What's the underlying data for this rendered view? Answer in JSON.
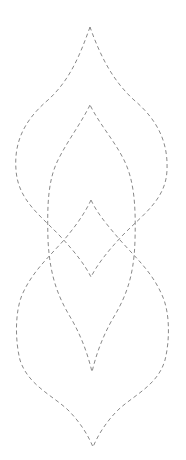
{
  "style": {
    "background": "#ffffff",
    "stroke_color": "#7a7a7a",
    "line_style": "dashed"
  },
  "shapes": [
    {
      "name": "outer-upper-leaf",
      "description": "large pointed leaf, tip at top, closes at center-diamond bottom"
    },
    {
      "name": "inner-upper-leaf",
      "description": "smaller pointed leaf nested inside, tip below outer tip, closes at lower inner point"
    },
    {
      "name": "center-diamond-outer-lower-leaf",
      "description": "lines from center apex flowing out into large lower leaf ending at bottom tip"
    },
    {
      "name": "inner-lower-leaf",
      "description": "inner lower pointed leaf formed by crossing curves"
    }
  ]
}
